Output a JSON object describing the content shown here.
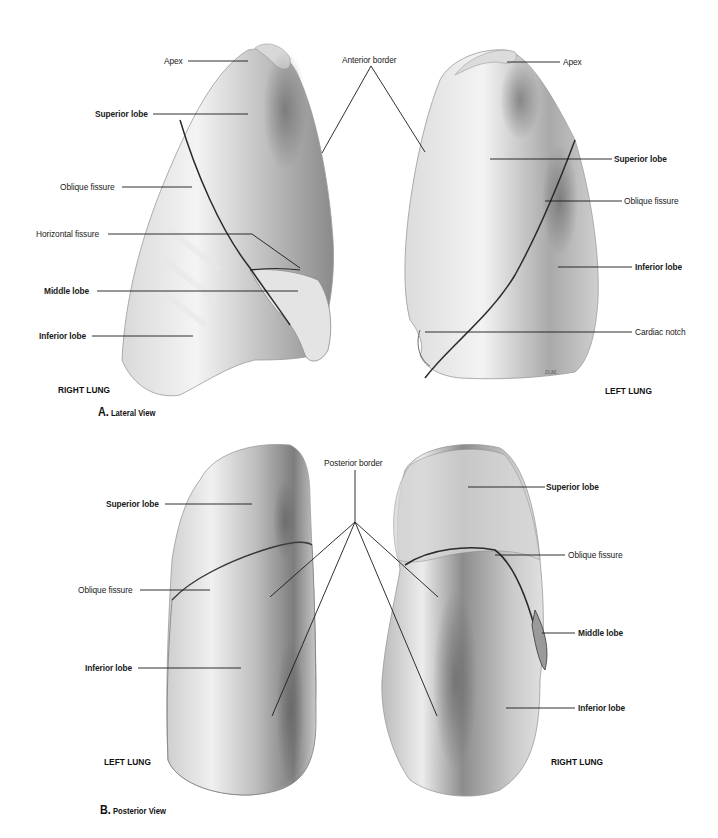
{
  "figure": {
    "panel_a": {
      "letter": "A.",
      "title": "Lateral View",
      "right_lung": {
        "name": "RIGHT LUNG",
        "labels": {
          "apex": "Apex",
          "superior_lobe": "Superior lobe",
          "oblique_fissure": "Oblique fissure",
          "horizontal_fissure": "Horizontal fissure",
          "middle_lobe": "Middle lobe",
          "inferior_lobe": "Inferior lobe"
        }
      },
      "shared": {
        "anterior_border": "Anterior border"
      },
      "left_lung": {
        "name": "LEFT LUNG",
        "labels": {
          "apex": "Apex",
          "superior_lobe": "Superior lobe",
          "oblique_fissure": "Oblique fissure",
          "inferior_lobe": "Inferior lobe",
          "cardiac_notch": "Cardiac notch"
        },
        "signature": "D.M."
      }
    },
    "panel_b": {
      "letter": "B.",
      "title": "Posterior View",
      "left_lung": {
        "name": "LEFT LUNG",
        "labels": {
          "superior_lobe": "Superior lobe",
          "oblique_fissure": "Oblique fissure",
          "inferior_lobe": "Inferior lobe"
        }
      },
      "shared": {
        "posterior_border": "Posterior border"
      },
      "right_lung": {
        "name": "RIGHT LUNG",
        "labels": {
          "superior_lobe": "Superior lobe",
          "oblique_fissure": "Oblique fissure",
          "middle_lobe": "Middle lobe",
          "inferior_lobe": "Inferior lobe"
        }
      }
    },
    "colors": {
      "background": "#ffffff",
      "tissue_light": "#f2f2f2",
      "tissue_mid": "#bdbdbd",
      "tissue_dark": "#6e6e6e",
      "leader_line": "#1a1a1a"
    }
  }
}
